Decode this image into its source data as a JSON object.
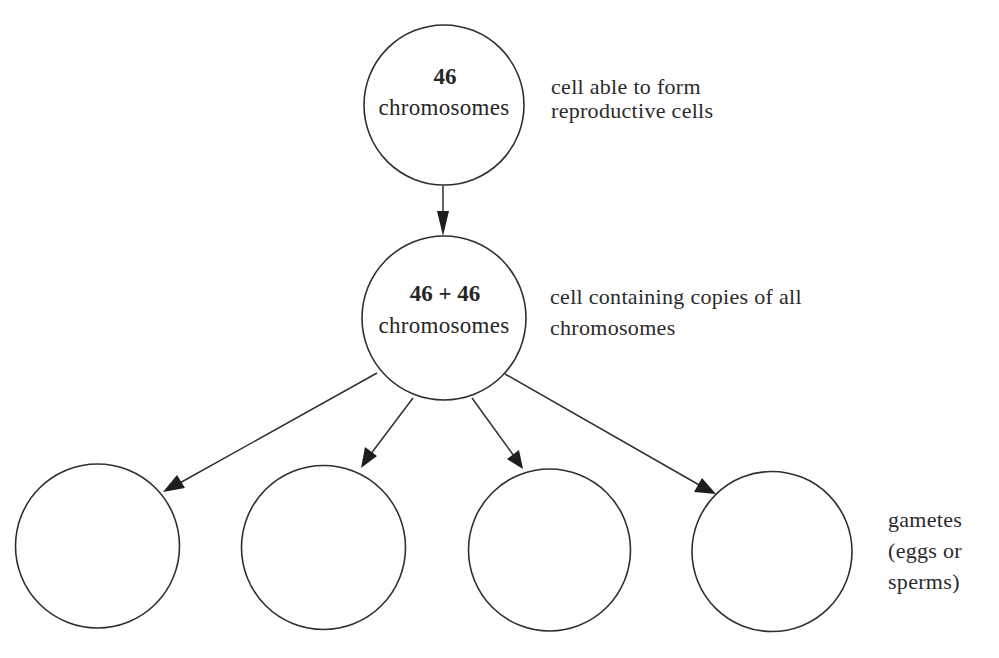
{
  "diagram": {
    "title": "",
    "colors": {
      "stroke": "#2f2f2f",
      "text": "#262626",
      "background": "#ffffff"
    },
    "nodes": [
      {
        "id": "parent-cell",
        "count": "46",
        "unit": "chromosomes",
        "label_lines": [
          "cell able to form",
          "reproductive cells"
        ]
      },
      {
        "id": "replicated-cell",
        "count": "46 + 46",
        "unit": "chromosomes",
        "label_lines": [
          "cell containing copies of all",
          "chromosomes"
        ]
      },
      {
        "id": "gamete-1",
        "count": "",
        "unit": ""
      },
      {
        "id": "gamete-2",
        "count": "",
        "unit": ""
      },
      {
        "id": "gamete-3",
        "count": "",
        "unit": ""
      },
      {
        "id": "gamete-4",
        "count": "",
        "unit": ""
      }
    ],
    "gametes_label_lines": [
      "gametes",
      "(eggs or",
      "sperms)"
    ],
    "edges": [
      {
        "from": "parent-cell",
        "to": "replicated-cell"
      },
      {
        "from": "replicated-cell",
        "to": "gamete-1"
      },
      {
        "from": "replicated-cell",
        "to": "gamete-2"
      },
      {
        "from": "replicated-cell",
        "to": "gamete-3"
      },
      {
        "from": "replicated-cell",
        "to": "gamete-4"
      }
    ]
  }
}
